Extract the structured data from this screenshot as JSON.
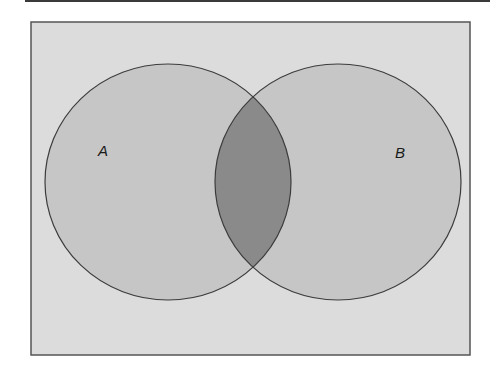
{
  "diagram": {
    "type": "venn",
    "sets": [
      {
        "id": "A",
        "label": "A"
      },
      {
        "id": "B",
        "label": "B"
      }
    ],
    "intersection": {
      "label": "",
      "sets": [
        "A",
        "B"
      ],
      "highlighted": true
    },
    "colors": {
      "frame_fill": "#dcdcdc",
      "frame_stroke": "#555555",
      "circle_fill": "#c6c6c6",
      "circle_stroke": "#3c3c3c",
      "intersection_fill": "#8a8a8a",
      "top_rule": "#3a3a3a"
    }
  }
}
